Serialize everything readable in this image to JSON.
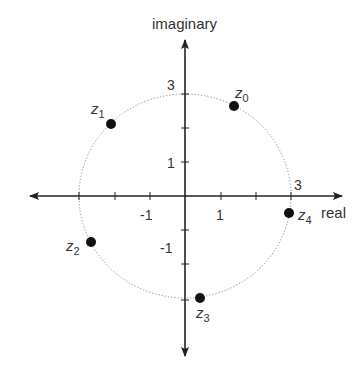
{
  "diagram": {
    "title": "",
    "axis_labels": {
      "x": "real",
      "y": "imaginary"
    },
    "tick_labels": {
      "x": [
        {
          "value": -1,
          "label": "-1"
        },
        {
          "value": 1,
          "label": "1"
        },
        {
          "value": 3,
          "label": "3"
        }
      ],
      "y": [
        {
          "value": 3,
          "label": "3"
        },
        {
          "value": 1,
          "label": "1"
        },
        {
          "value": -1,
          "label": "-1"
        }
      ]
    },
    "circle": {
      "radius": 3,
      "style": "dotted"
    },
    "points": [
      {
        "label": "z",
        "sub": "0",
        "x": 1.39,
        "y": 2.65
      },
      {
        "label": "z",
        "sub": "1",
        "x": -2.09,
        "y": 2.12
      },
      {
        "label": "z",
        "sub": "2",
        "x": -2.66,
        "y": -1.35
      },
      {
        "label": "z",
        "sub": "3",
        "x": 0.42,
        "y": -2.99
      },
      {
        "label": "z",
        "sub": "4",
        "x": 2.95,
        "y": -0.5
      }
    ]
  }
}
